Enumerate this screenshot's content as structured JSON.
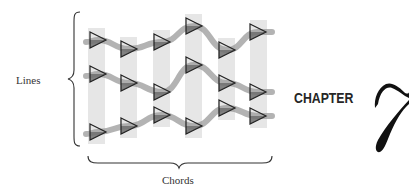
{
  "diagram": {
    "labels": {
      "lines": "Lines",
      "chords": "Chords"
    },
    "chapter": {
      "word": "CHAPTER",
      "number": "7"
    },
    "colors": {
      "bar": "#e6e6e6",
      "ribbon": "#9a9a9a",
      "triangle_stroke": "#222222",
      "triangle_fill": "#6f6f6f",
      "brace": "#333333",
      "text": "#333333"
    },
    "chords": [
      {
        "index": 1,
        "x": 88,
        "width": 17
      },
      {
        "index": 2,
        "x": 120,
        "width": 17
      },
      {
        "index": 3,
        "x": 153,
        "width": 17
      },
      {
        "index": 4,
        "x": 185,
        "width": 17
      },
      {
        "index": 5,
        "x": 218,
        "width": 17
      },
      {
        "index": 6,
        "x": 250,
        "width": 17
      }
    ],
    "lines": [
      {
        "index": 1,
        "notes_y": [
          40,
          49,
          42,
          26,
          50,
          32
        ]
      },
      {
        "index": 2,
        "notes_y": [
          74,
          83,
          92,
          65,
          83,
          92
        ]
      },
      {
        "index": 3,
        "notes_y": [
          132,
          126,
          115,
          126,
          108,
          116
        ]
      }
    ],
    "note_x": [
      98,
      129,
      162,
      194,
      227,
      258
    ],
    "icon": "triangle-note-icon"
  }
}
